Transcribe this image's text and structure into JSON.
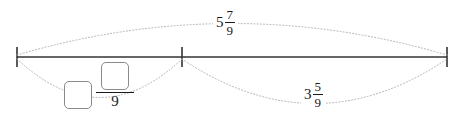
{
  "diagram": {
    "type": "number-line-with-arcs",
    "canvas": {
      "width": 467,
      "height": 127,
      "background": "#ffffff"
    },
    "line": {
      "color": "#333333",
      "y": 57,
      "ticks": [
        {
          "name": "left-endpoint",
          "x": 17
        },
        {
          "name": "middle-tick",
          "x": 182
        },
        {
          "name": "right-endpoint",
          "x": 447
        }
      ]
    },
    "arcs": [
      {
        "name": "total-arc",
        "position": "above",
        "from_x": 17,
        "to_x": 447,
        "peak_y": 22,
        "style": "dotted",
        "color": "#aaaaaa"
      },
      {
        "name": "unknown-part-arc",
        "position": "below",
        "from_x": 17,
        "to_x": 182,
        "peak_y": 97,
        "style": "dotted",
        "color": "#aaaaaa"
      },
      {
        "name": "known-part-arc",
        "position": "below",
        "from_x": 182,
        "to_x": 447,
        "peak_y": 103,
        "style": "dotted",
        "color": "#aaaaaa"
      }
    ]
  },
  "labels": {
    "total": {
      "name": "total-label",
      "whole": "5",
      "numerator": "7",
      "denominator": "9",
      "text": "5 7/9",
      "x": 233,
      "y": 23
    },
    "known_part": {
      "name": "known-part-label",
      "whole": "3",
      "numerator": "5",
      "denominator": "9",
      "text": "3 5/9",
      "x": 320,
      "y": 96
    }
  },
  "answer_input": {
    "name": "mixed-number-answer",
    "whole_box": {
      "value": "",
      "placeholder": ""
    },
    "numerator_box": {
      "value": "",
      "placeholder": ""
    },
    "denominator": "9"
  }
}
